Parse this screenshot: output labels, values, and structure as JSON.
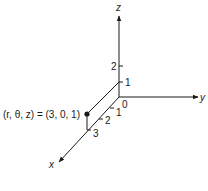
{
  "diagram": {
    "axes": {
      "z": {
        "label": "z"
      },
      "y": {
        "label": "y"
      },
      "x": {
        "label": "x"
      }
    },
    "origin_label": "0",
    "z_ticks": [
      "1",
      "2"
    ],
    "x_ticks": [
      "1",
      "2",
      "3"
    ],
    "point": {
      "label": "(r, θ, z) = (3, 0, 1)",
      "r": 3,
      "theta": 0,
      "z": 1
    },
    "colors": {
      "line": "#1a1a1a",
      "background": "#ffffff"
    }
  }
}
